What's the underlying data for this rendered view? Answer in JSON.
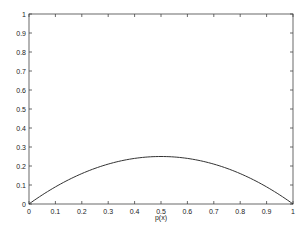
{
  "chart_data": {
    "type": "line",
    "title": "",
    "xlabel": "p(x)",
    "ylabel": "",
    "xlim": [
      0,
      1
    ],
    "ylim": [
      0,
      1
    ],
    "xticks": [
      "0",
      "0.1",
      "0.2",
      "0.3",
      "0.4",
      "0.5",
      "0.6",
      "0.7",
      "0.8",
      "0.9",
      "1"
    ],
    "yticks": [
      "0",
      "0.1",
      "0.2",
      "0.3",
      "0.4",
      "0.5",
      "0.6",
      "0.7",
      "0.8",
      "0.9",
      "1"
    ],
    "grid": false,
    "series": [
      {
        "name": "p(1-p)",
        "x": [
          0,
          0.1,
          0.2,
          0.3,
          0.4,
          0.5,
          0.6,
          0.7,
          0.8,
          0.9,
          1
        ],
        "values": [
          0,
          0.09,
          0.16,
          0.21,
          0.24,
          0.25,
          0.24,
          0.21,
          0.16,
          0.09,
          0
        ],
        "color": "#333333"
      }
    ]
  }
}
